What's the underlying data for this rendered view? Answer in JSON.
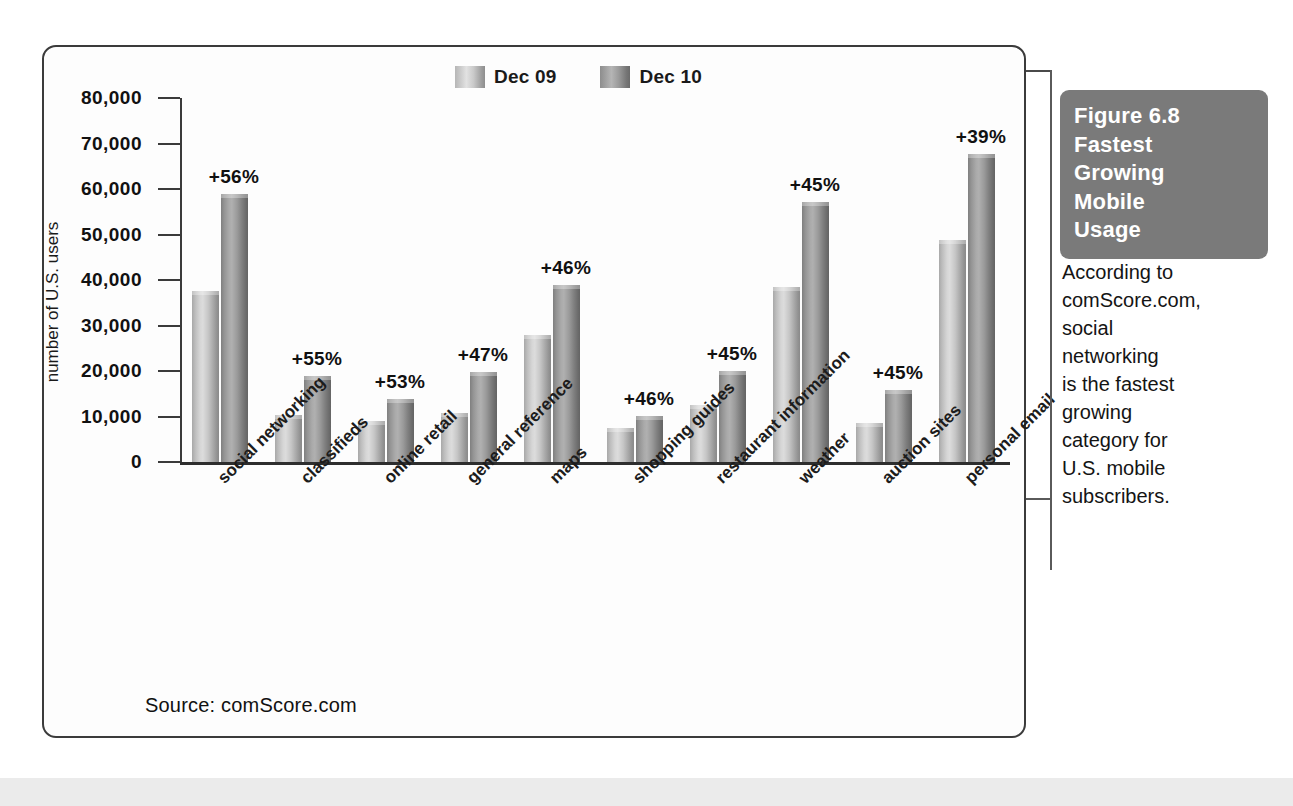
{
  "chart_data": {
    "type": "bar",
    "title": "",
    "xlabel": "",
    "ylabel": "number of U.S. users",
    "ylim": [
      0,
      80000
    ],
    "ytick_labels": [
      "80,000",
      "70,000",
      "60,000",
      "50,000",
      "40,000",
      "30,000",
      "20,000",
      "10,000",
      "0"
    ],
    "ytick_values": [
      80000,
      70000,
      60000,
      50000,
      40000,
      30000,
      20000,
      10000,
      0
    ],
    "grid": false,
    "legend_position": "top-center",
    "categories": [
      "social networking",
      "classifieds",
      "online retail",
      "general reference",
      "maps",
      "shopping guides",
      "restaurant information",
      "weather",
      "auction sites",
      "personal email"
    ],
    "series": [
      {
        "name": "Dec 09",
        "color": "#c6c6c6",
        "values": [
          37500,
          10400,
          9100,
          10700,
          28000,
          7400,
          12500,
          38500,
          8600,
          48800
        ]
      },
      {
        "name": "Dec 10",
        "color": "#9a9a9a",
        "values": [
          58800,
          18800,
          13900,
          19700,
          39000,
          10200,
          20000,
          57200,
          15800,
          67800
        ]
      }
    ],
    "annotations": [
      "+56%",
      "+55%",
      "+53%",
      "+47%",
      "+46%",
      "+46%",
      "+45%",
      "+45%",
      "+45%",
      "+39%"
    ],
    "source_note": "Source: comScore.com"
  },
  "legend": {
    "items": [
      {
        "label": "Dec 09",
        "swatch": "light-gray"
      },
      {
        "label": "Dec 10",
        "swatch": "dark-gray"
      }
    ]
  },
  "caption": {
    "figure_lines": [
      "Figure 6.8",
      "Fastest",
      "Growing",
      "Mobile",
      "Usage"
    ],
    "body_lines": [
      "According to",
      "comScore.com,",
      "social",
      "networking",
      "is the fastest",
      "growing",
      "category for",
      "U.S. mobile",
      "subscribers."
    ]
  }
}
